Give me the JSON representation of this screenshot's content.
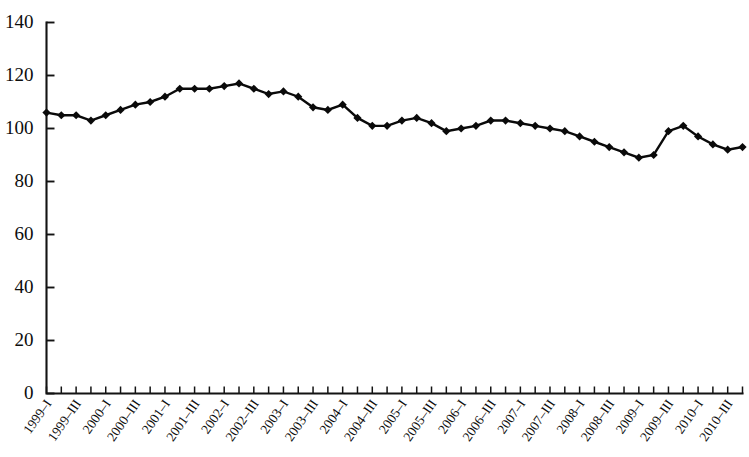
{
  "chart_data": {
    "type": "line",
    "title": "",
    "subtitle": "",
    "xlabel": "",
    "ylabel": "",
    "ylim": [
      0,
      140
    ],
    "ytick_values": [
      0,
      20,
      40,
      60,
      80,
      100,
      120,
      140
    ],
    "ytick_labels": [
      "0",
      "20",
      "40",
      "60",
      "80",
      "100",
      "120",
      "140"
    ],
    "grid": false,
    "legend": false,
    "legend_position": "none",
    "marker": "diamond",
    "line_color": "#0a0a0a",
    "marker_color": "#0a0a0a",
    "axis_color": "#131313",
    "background_color": "#ffffff",
    "categories": [
      "1999–I",
      "1999–II",
      "1999–III",
      "1999–IV",
      "2000–I",
      "2000–II",
      "2000–III",
      "2000–IV",
      "2001–I",
      "2001–II",
      "2001–III",
      "2001–IV",
      "2002–I",
      "2002–II",
      "2002–III",
      "2002–IV",
      "2003–I",
      "2003–II",
      "2003–III",
      "2003–IV",
      "2004–I",
      "2004–II",
      "2004–III",
      "2004–IV",
      "2005–I",
      "2005–II",
      "2005–III",
      "2005–IV",
      "2006–I",
      "2006–II",
      "2006–III",
      "2006–IV",
      "2007–I",
      "2007–II",
      "2007–III",
      "2007–IV",
      "2008–I",
      "2008–II",
      "2008–III",
      "2008–IV",
      "2009–I",
      "2009–II",
      "2009–III",
      "2009–IV",
      "2010–I",
      "2010–II",
      "2010–III",
      "2010–IV"
    ],
    "xtick_labels_shown": [
      "1999–I",
      "1999–III",
      "2000–I",
      "2000–III",
      "2001–I",
      "2001–III",
      "2002–I",
      "2002–III",
      "2003–I",
      "2003–III",
      "2004–I",
      "2004–III",
      "2005–I",
      "2005–III",
      "2006–I",
      "2006–III",
      "2007–I",
      "2007–III",
      "2008–I",
      "2008–III",
      "2009–I",
      "2009–III",
      "2010–I",
      "2010–III"
    ],
    "values": [
      106,
      105,
      105,
      103,
      105,
      107,
      109,
      110,
      112,
      115,
      115,
      115,
      116,
      117,
      115,
      113,
      114,
      112,
      108,
      107,
      109,
      104,
      101,
      101,
      103,
      104,
      102,
      99,
      100,
      101,
      103,
      103,
      102,
      101,
      100,
      99,
      97,
      95,
      93,
      91,
      89,
      90,
      99,
      101,
      97,
      94,
      92,
      93
    ]
  }
}
